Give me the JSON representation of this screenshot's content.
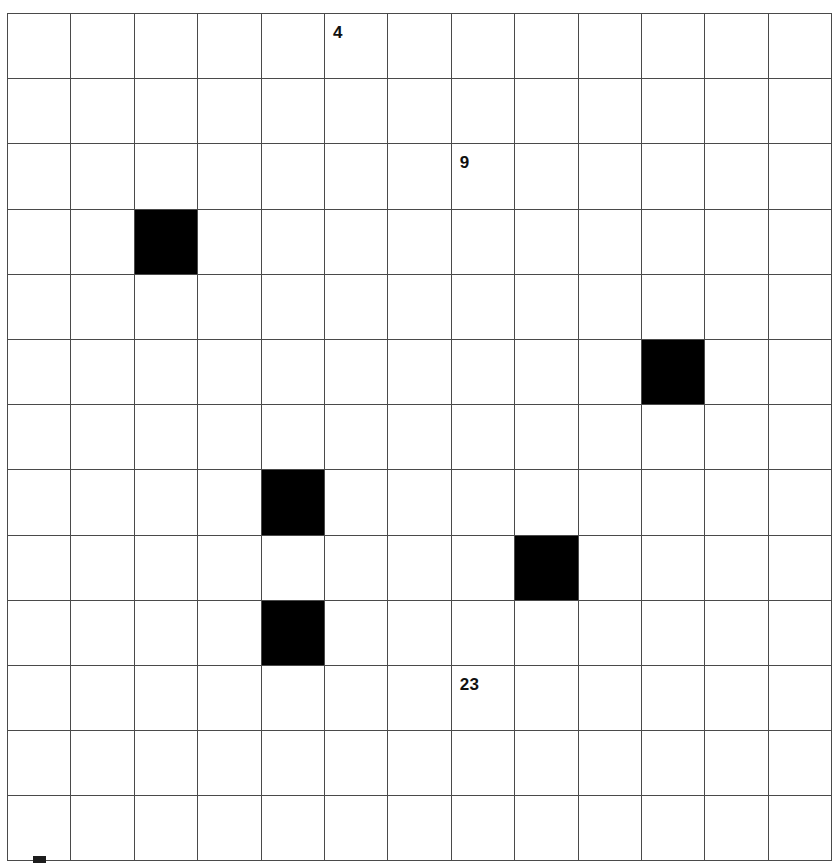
{
  "puzzle": {
    "kind": "nonogram-style blank grid with clue numbers",
    "columns": 13,
    "rows": 13,
    "colors": {
      "background": "#ffffff",
      "grid_line": "#4a4a4a",
      "filled_cell": "#000000",
      "label_text": "#111111"
    },
    "filled_cells": [
      {
        "col": 2,
        "row": 3
      },
      {
        "col": 10,
        "row": 5
      },
      {
        "col": 4,
        "row": 7
      },
      {
        "col": 8,
        "row": 8
      },
      {
        "col": 4,
        "row": 9
      }
    ],
    "labels": [
      {
        "col": 5,
        "row": 0,
        "text": "4"
      },
      {
        "col": 7,
        "row": 2,
        "text": "9"
      },
      {
        "col": 7,
        "row": 10,
        "text": "23"
      }
    ],
    "stray_marks": [
      {
        "name": "clipped-mark-below-grid",
        "x": 33,
        "y": 856,
        "width": 13,
        "height": 7
      }
    ]
  },
  "chart_data": {
    "type": "heatmap",
    "title": "",
    "xlabel": "",
    "ylabel": "",
    "grid": true,
    "legend": "none",
    "categories_x": [
      "1",
      "2",
      "3",
      "4",
      "5",
      "6",
      "7",
      "8",
      "9",
      "10",
      "11",
      "12",
      "13"
    ],
    "categories_y": [
      "1",
      "2",
      "3",
      "4",
      "5",
      "6",
      "7",
      "8",
      "9",
      "10",
      "11",
      "12",
      "13"
    ],
    "values": [
      [
        0,
        0,
        0,
        0,
        0,
        0,
        0,
        0,
        0,
        0,
        0,
        0,
        0
      ],
      [
        0,
        0,
        0,
        0,
        0,
        0,
        0,
        0,
        0,
        0,
        0,
        0,
        0
      ],
      [
        0,
        0,
        0,
        0,
        0,
        0,
        0,
        0,
        0,
        0,
        0,
        0,
        0
      ],
      [
        0,
        0,
        1,
        0,
        0,
        0,
        0,
        0,
        0,
        0,
        0,
        0,
        0
      ],
      [
        0,
        0,
        0,
        0,
        0,
        0,
        0,
        0,
        0,
        0,
        0,
        0,
        0
      ],
      [
        0,
        0,
        0,
        0,
        0,
        0,
        0,
        0,
        0,
        0,
        1,
        0,
        0
      ],
      [
        0,
        0,
        0,
        0,
        0,
        0,
        0,
        0,
        0,
        0,
        0,
        0,
        0
      ],
      [
        0,
        0,
        0,
        0,
        1,
        0,
        0,
        0,
        0,
        0,
        0,
        0,
        0
      ],
      [
        0,
        0,
        0,
        0,
        0,
        0,
        0,
        0,
        1,
        0,
        0,
        0,
        0
      ],
      [
        0,
        0,
        0,
        0,
        1,
        0,
        0,
        0,
        0,
        0,
        0,
        0,
        0
      ],
      [
        0,
        0,
        0,
        0,
        0,
        0,
        0,
        0,
        0,
        0,
        0,
        0,
        0
      ],
      [
        0,
        0,
        0,
        0,
        0,
        0,
        0,
        0,
        0,
        0,
        0,
        0,
        0
      ],
      [
        0,
        0,
        0,
        0,
        0,
        0,
        0,
        0,
        0,
        0,
        0,
        0,
        0
      ]
    ],
    "annotations": [
      {
        "text": "4",
        "x": 5,
        "y": 0
      },
      {
        "text": "9",
        "x": 7,
        "y": 2
      },
      {
        "text": "23",
        "x": 7,
        "y": 10
      }
    ]
  }
}
